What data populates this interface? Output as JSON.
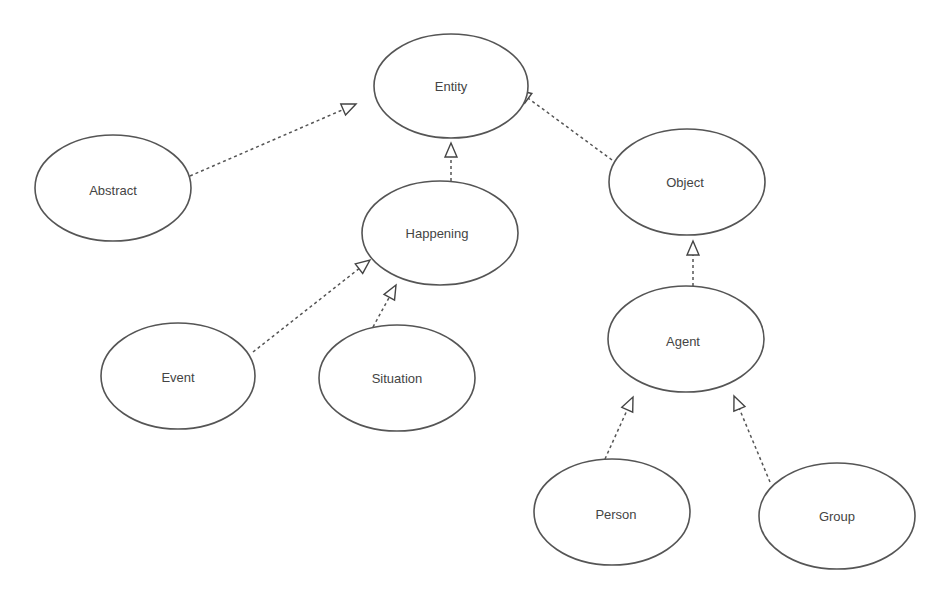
{
  "diagram": {
    "type": "class-hierarchy",
    "nodes": [
      {
        "id": "entity",
        "label": "Entity",
        "cx": 451,
        "cy": 86,
        "rx": 77,
        "ry": 52
      },
      {
        "id": "abstract",
        "label": "Abstract",
        "cx": 113,
        "cy": 188,
        "rx": 78,
        "ry": 53
      },
      {
        "id": "happening",
        "label": "Happening",
        "cx": 440,
        "cy": 233,
        "rx": 78,
        "ry": 52
      },
      {
        "id": "object",
        "label": "Object",
        "cx": 687,
        "cy": 182,
        "rx": 78,
        "ry": 53
      },
      {
        "id": "event",
        "label": "Event",
        "cx": 178,
        "cy": 376,
        "rx": 77,
        "ry": 53
      },
      {
        "id": "situation",
        "label": "Situation",
        "cx": 397,
        "cy": 378,
        "rx": 78,
        "ry": 53
      },
      {
        "id": "agent",
        "label": "Agent",
        "cx": 686,
        "cy": 339,
        "rx": 78,
        "ry": 53
      },
      {
        "id": "person",
        "label": "Person",
        "cx": 612,
        "cy": 512,
        "rx": 78,
        "ry": 53
      },
      {
        "id": "group",
        "label": "Group",
        "cx": 837,
        "cy": 516,
        "rx": 78,
        "ry": 53
      }
    ],
    "edges": [
      {
        "from": "abstract",
        "to": "entity",
        "x1": 190,
        "y1": 176,
        "x2": 356,
        "y2": 104,
        "style": "dashed",
        "arrow": "hollow-triangle"
      },
      {
        "from": "happening",
        "to": "entity",
        "x1": 451,
        "y1": 181,
        "x2": 451,
        "y2": 143,
        "style": "dashed",
        "arrow": "hollow-triangle"
      },
      {
        "from": "object",
        "to": "entity",
        "x1": 612,
        "y1": 160,
        "x2": 517,
        "y2": 90,
        "style": "dashed",
        "arrow": "hollow-triangle"
      },
      {
        "from": "event",
        "to": "happening",
        "x1": 253,
        "y1": 352,
        "x2": 370,
        "y2": 260,
        "style": "dashed",
        "arrow": "hollow-triangle"
      },
      {
        "from": "situation",
        "to": "happening",
        "x1": 373,
        "y1": 327,
        "x2": 396,
        "y2": 285,
        "style": "dashed",
        "arrow": "hollow-triangle"
      },
      {
        "from": "agent",
        "to": "object",
        "x1": 693,
        "y1": 286,
        "x2": 693,
        "y2": 241,
        "style": "dashed",
        "arrow": "hollow-triangle"
      },
      {
        "from": "person",
        "to": "agent",
        "x1": 605,
        "y1": 459,
        "x2": 633,
        "y2": 397,
        "style": "dashed",
        "arrow": "hollow-triangle"
      },
      {
        "from": "group",
        "to": "agent",
        "x1": 770,
        "y1": 482,
        "x2": 734,
        "y2": 396,
        "style": "dashed",
        "arrow": "hollow-triangle"
      }
    ]
  },
  "labels": {
    "entity": "Entity",
    "abstract": "Abstract",
    "happening": "Happening",
    "object": "Object",
    "event": "Event",
    "situation": "Situation",
    "agent": "Agent",
    "person": "Person",
    "group": "Group"
  },
  "colors": {
    "stroke": "#555555",
    "text": "#444444",
    "background": "#ffffff"
  }
}
